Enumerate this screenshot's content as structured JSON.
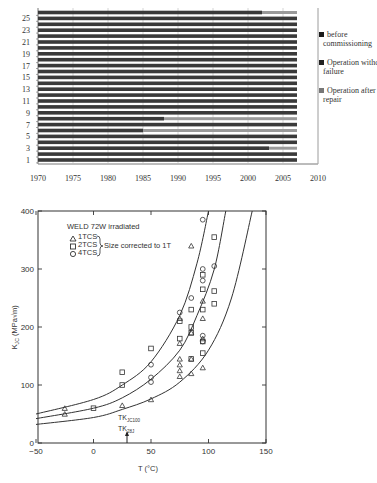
{
  "chart_data": [
    {
      "type": "bar",
      "orientation": "horizontal",
      "stacked": true,
      "title": "",
      "xlabel": "",
      "ylabel": "",
      "xlim": [
        1970,
        2010
      ],
      "x_ticks": [
        "1970",
        "1975",
        "1980",
        "1985",
        "1990",
        "1995",
        "2000",
        "2005",
        "2010"
      ],
      "y_ticks": [
        "1",
        "3",
        "5",
        "7",
        "9",
        "11",
        "13",
        "15",
        "17",
        "19",
        "21",
        "23",
        "25"
      ],
      "categories": [
        1,
        2,
        3,
        4,
        5,
        6,
        7,
        8,
        9,
        10,
        11,
        12,
        13,
        14,
        15,
        16,
        17,
        18,
        19,
        20,
        21,
        22,
        23,
        24,
        25,
        26
      ],
      "grid": "vertical",
      "legend_position": "right",
      "legend": [
        {
          "label": "before commissioning",
          "color": "#1a1a1a"
        },
        {
          "label": "Operation without failure",
          "color": "#333333"
        },
        {
          "label": "Operation after repair",
          "color": "#8a8a8a"
        }
      ],
      "series": [
        {
          "name": "Operation without failure",
          "start": 1970,
          "end_values": [
            2007,
            2007,
            2003,
            2007,
            2007,
            1985,
            2007,
            1988,
            2007,
            2007,
            2007,
            2007,
            2007,
            2007,
            2007,
            2007,
            2007,
            2007,
            2007,
            2007,
            2007,
            2007,
            2007,
            2007,
            2007,
            2002
          ]
        },
        {
          "name": "Operation after repair",
          "start_values": [
            null,
            null,
            2003,
            null,
            null,
            1985,
            null,
            1988,
            null,
            null,
            null,
            null,
            null,
            null,
            null,
            null,
            null,
            null,
            null,
            null,
            null,
            null,
            null,
            null,
            null,
            2002
          ],
          "end": 2007
        }
      ]
    },
    {
      "type": "scatter",
      "title": "WELD 72W irradiated",
      "annotation": "Size corrected to 1T",
      "marker_note": "TK_JC100 / TK_28J at T≈30 °C",
      "xlabel": "T (°C)",
      "ylabel": "K_JC (MPa√m)",
      "xlim": [
        -50,
        150
      ],
      "ylim": [
        0,
        400
      ],
      "x_ticks": [
        "-50",
        "0",
        "50",
        "100",
        "150"
      ],
      "y_ticks": [
        "0",
        "100",
        "200",
        "300",
        "400"
      ],
      "legend": [
        {
          "label": "1TCS",
          "marker": "triangle"
        },
        {
          "label": "2TCS",
          "marker": "square"
        },
        {
          "label": "4TCS",
          "marker": "circle"
        }
      ],
      "series": [
        {
          "name": "1TCS",
          "marker": "triangle",
          "points": [
            [
              -25,
              50
            ],
            [
              -25,
              60
            ],
            [
              25,
              65
            ],
            [
              50,
              75
            ],
            [
              75,
              115
            ],
            [
              75,
              125
            ],
            [
              75,
              135
            ],
            [
              75,
              145
            ],
            [
              75,
              172
            ],
            [
              75,
              215
            ],
            [
              85,
              120
            ],
            [
              85,
              145
            ],
            [
              85,
              190
            ],
            [
              85,
              340
            ],
            [
              95,
              130
            ],
            [
              95,
              180
            ],
            [
              95,
              215
            ],
            [
              95,
              245
            ]
          ]
        },
        {
          "name": "2TCS",
          "marker": "square",
          "points": [
            [
              0,
              60
            ],
            [
              25,
              100
            ],
            [
              25,
              122
            ],
            [
              50,
              163
            ],
            [
              75,
              180
            ],
            [
              75,
              210
            ],
            [
              85,
              145
            ],
            [
              85,
              190
            ],
            [
              85,
              200
            ],
            [
              85,
              230
            ],
            [
              95,
              155
            ],
            [
              95,
              175
            ],
            [
              95,
              230
            ],
            [
              95,
              265
            ],
            [
              95,
              290
            ],
            [
              105,
              240
            ],
            [
              105,
              262
            ],
            [
              105,
              355
            ]
          ]
        },
        {
          "name": "4TCS",
          "marker": "circle",
          "points": [
            [
              50,
              105
            ],
            [
              50,
              113
            ],
            [
              50,
              135
            ],
            [
              75,
              225
            ],
            [
              85,
              250
            ],
            [
              95,
              175
            ],
            [
              95,
              185
            ],
            [
              95,
              280
            ],
            [
              95,
              300
            ],
            [
              95,
              385
            ],
            [
              105,
              305
            ]
          ]
        }
      ],
      "curves": [
        {
          "name": "upper",
          "points": [
            [
              -50,
              50
            ],
            [
              0,
              75
            ],
            [
              25,
              100
            ],
            [
              50,
              140
            ],
            [
              75,
              220
            ],
            [
              90,
              310
            ],
            [
              100,
              400
            ]
          ]
        },
        {
          "name": "median",
          "points": [
            [
              -50,
              42
            ],
            [
              0,
              60
            ],
            [
              25,
              78
            ],
            [
              50,
              110
            ],
            [
              75,
              160
            ],
            [
              90,
              220
            ],
            [
              105,
              300
            ],
            [
              115,
              400
            ]
          ]
        },
        {
          "name": "lower",
          "points": [
            [
              -50,
              32
            ],
            [
              0,
              44
            ],
            [
              25,
              58
            ],
            [
              50,
              76
            ],
            [
              75,
              105
            ],
            [
              100,
              160
            ],
            [
              120,
              250
            ],
            [
              138,
              400
            ]
          ]
        }
      ]
    }
  ],
  "top_chart": {
    "x_ticks": [
      "1970",
      "1975",
      "1980",
      "1985",
      "1990",
      "1995",
      "2000",
      "2005",
      "2010"
    ],
    "y_ticks": [
      "1",
      "3",
      "5",
      "7",
      "9",
      "11",
      "13",
      "15",
      "17",
      "19",
      "21",
      "23",
      "25"
    ],
    "legend": [
      {
        "line1": "before",
        "line2": "commissioning"
      },
      {
        "line1": "Operation without",
        "line2": "failure"
      },
      {
        "line1": "Operation after",
        "line2": "repair"
      }
    ]
  },
  "bottom_chart": {
    "title": "WELD 72W irradiated",
    "legend": [
      "1TCS",
      "2TCS",
      "4TCS"
    ],
    "legend_note": "Size corrected to 1T",
    "x_ticks": [
      "−50",
      "0",
      "50",
      "100",
      "150"
    ],
    "y_ticks": [
      "0",
      "100",
      "200",
      "300",
      "400"
    ],
    "xlabel": "T (°C)",
    "ylabel_main": "K",
    "ylabel_sub": "JC",
    "ylabel_unit": "(MPa√m)",
    "marker_label_1": "TK",
    "marker_label_1_sub": "JC100",
    "marker_label_2": "TK",
    "marker_label_2_sub": "28J"
  }
}
